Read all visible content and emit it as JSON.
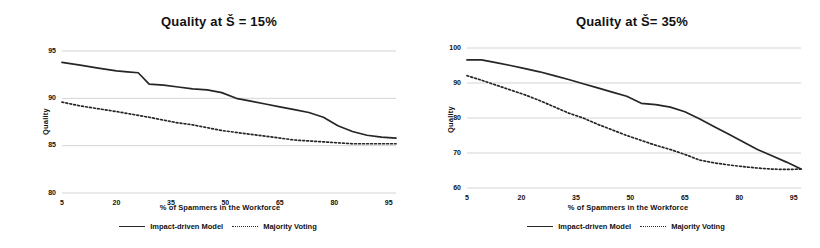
{
  "figure": {
    "background": "#ffffff",
    "line_color": "#262626",
    "grid_color": "#c9c9c9"
  },
  "panels": [
    {
      "id": "left",
      "title": "Quality at Š = 15%",
      "axis_title_y": "Quality",
      "axis_title_x": "% of Spammers in the Workforce",
      "legend": [
        {
          "label": "Impact-driven Model",
          "style": "solid"
        },
        {
          "label": "Majority Voting",
          "style": "dotted"
        }
      ]
    },
    {
      "id": "right",
      "title": "Quality at Š= 35%",
      "axis_title_y": "Quality",
      "axis_title_x": "% of Spammers in the Workforce",
      "legend": [
        {
          "label": "Impact-driven Model",
          "style": "solid"
        },
        {
          "label": "Majority Voting",
          "style": "dotted"
        }
      ]
    }
  ],
  "chart_data": [
    {
      "type": "line",
      "title": "Quality at Š = 15%",
      "xlabel": "% of Spammers in the Workforce",
      "ylabel": "Quality",
      "xlim": [
        5,
        97
      ],
      "ylim": [
        80,
        95
      ],
      "xticks": [
        5,
        20,
        35,
        50,
        65,
        80,
        95
      ],
      "yticks": [
        80,
        85,
        90,
        95
      ],
      "grid": true,
      "legend_position": "bottom",
      "x": [
        5,
        10,
        15,
        20,
        23,
        26,
        29,
        33,
        37,
        41,
        45,
        49,
        53,
        57,
        61,
        65,
        69,
        73,
        77,
        81,
        85,
        89,
        93,
        97
      ],
      "series": [
        {
          "name": "Impact-driven Model",
          "style": "solid",
          "values": [
            93.8,
            93.5,
            93.2,
            92.9,
            92.8,
            92.7,
            91.5,
            91.4,
            91.2,
            91.0,
            90.9,
            90.6,
            90.0,
            89.7,
            89.4,
            89.1,
            88.8,
            88.5,
            88.0,
            87.1,
            86.5,
            86.1,
            85.9,
            85.8
          ]
        },
        {
          "name": "Majority Voting",
          "style": "dotted",
          "values": [
            89.6,
            89.2,
            88.9,
            88.6,
            88.4,
            88.2,
            88.0,
            87.7,
            87.4,
            87.2,
            86.9,
            86.6,
            86.4,
            86.2,
            86.0,
            85.8,
            85.6,
            85.5,
            85.4,
            85.3,
            85.2,
            85.2,
            85.2,
            85.2
          ]
        }
      ]
    },
    {
      "type": "line",
      "title": "Quality at Š= 35%",
      "xlabel": "% of Spammers in the Workforce",
      "ylabel": "Quality",
      "xlim": [
        5,
        97
      ],
      "ylim": [
        60,
        100
      ],
      "xticks": [
        5,
        20,
        35,
        50,
        65,
        80,
        95
      ],
      "yticks": [
        60,
        70,
        80,
        90,
        100
      ],
      "grid": true,
      "legend_position": "bottom",
      "x": [
        5,
        9,
        13,
        17,
        21,
        25,
        29,
        33,
        37,
        41,
        45,
        49,
        53,
        57,
        61,
        65,
        69,
        73,
        77,
        81,
        85,
        89,
        93,
        97
      ],
      "series": [
        {
          "name": "Impact-driven Model",
          "style": "solid",
          "values": [
            96.6,
            96.6,
            95.8,
            95.0,
            94.1,
            93.2,
            92.1,
            91.0,
            89.8,
            88.6,
            87.4,
            86.2,
            84.2,
            83.8,
            83.1,
            81.8,
            79.8,
            77.6,
            75.4,
            73.2,
            71.0,
            69.2,
            67.4,
            65.4
          ]
        },
        {
          "name": "Majority Voting",
          "style": "dotted",
          "values": [
            92.1,
            90.8,
            89.4,
            88.0,
            86.6,
            85.0,
            83.2,
            81.4,
            80.0,
            78.2,
            76.6,
            75.0,
            73.6,
            72.2,
            71.0,
            69.6,
            68.0,
            67.2,
            66.6,
            66.1,
            65.7,
            65.4,
            65.3,
            65.4
          ]
        }
      ]
    }
  ]
}
